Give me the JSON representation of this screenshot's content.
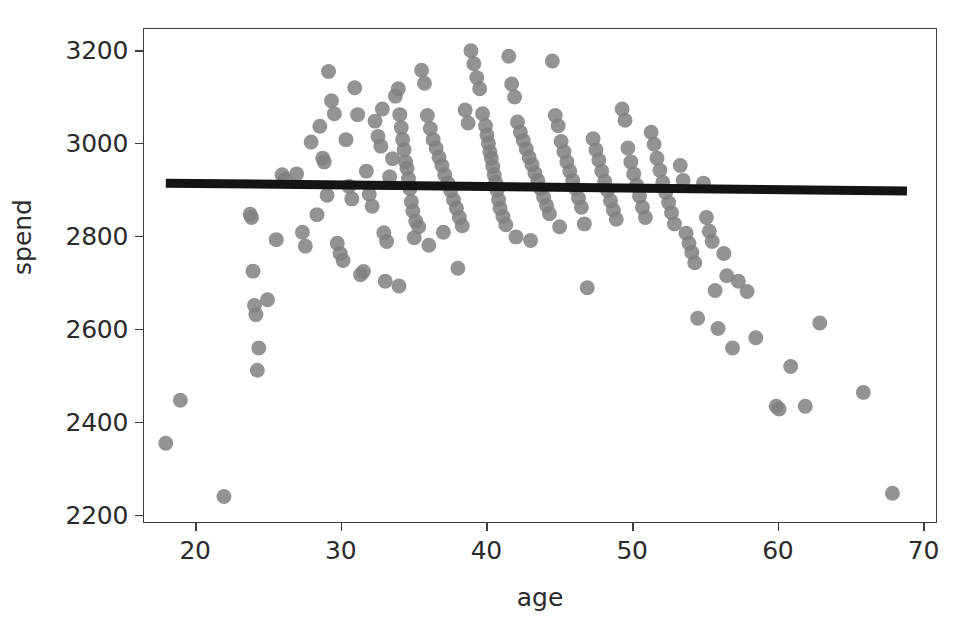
{
  "chart_data": {
    "type": "scatter",
    "title": "",
    "xlabel": "age",
    "ylabel": "spend",
    "xlim": [
      16.5,
      71.0
    ],
    "ylim": [
      2180,
      3245
    ],
    "xticks": [
      20,
      30,
      40,
      50,
      60,
      70
    ],
    "xtick_labels": [
      "20",
      "30",
      "40",
      "50",
      "60",
      "70"
    ],
    "yticks": [
      2200,
      2400,
      2600,
      2800,
      3000,
      3200
    ],
    "ytick_labels": [
      "2200",
      "2400",
      "2600",
      "2800",
      "3000",
      "3200"
    ],
    "grid": false,
    "legend": null,
    "marker": {
      "shape": "circle",
      "color": "#808080",
      "size_px": 15,
      "opacity": 0.85,
      "edge": "none"
    },
    "fit_line": {
      "name": "regression line",
      "color": "#141414",
      "width_px": 9,
      "x_start": 18.0,
      "x_end": 69.0,
      "y_start": 2912,
      "y_end": 2895
    },
    "series": [
      {
        "name": "spend vs age",
        "points": [
          [
            18.0,
            2350
          ],
          [
            19.0,
            2443
          ],
          [
            22.0,
            2235
          ],
          [
            23.8,
            2845
          ],
          [
            23.9,
            2838
          ],
          [
            24.0,
            2722
          ],
          [
            24.1,
            2648
          ],
          [
            24.2,
            2628
          ],
          [
            24.3,
            2508
          ],
          [
            24.4,
            2556
          ],
          [
            25.0,
            2660
          ],
          [
            25.6,
            2790
          ],
          [
            26.0,
            2930
          ],
          [
            26.2,
            2920
          ],
          [
            27.4,
            2806
          ],
          [
            27.6,
            2776
          ],
          [
            28.0,
            3001
          ],
          [
            28.6,
            3035
          ],
          [
            28.8,
            2966
          ],
          [
            28.9,
            2958
          ],
          [
            29.2,
            3153
          ],
          [
            29.4,
            3090
          ],
          [
            29.6,
            3062
          ],
          [
            29.8,
            2782
          ],
          [
            30.0,
            2760
          ],
          [
            30.2,
            2745
          ],
          [
            30.6,
            2905
          ],
          [
            30.8,
            2878
          ],
          [
            31.0,
            3118
          ],
          [
            31.2,
            3060
          ],
          [
            31.4,
            2714
          ],
          [
            31.6,
            2721
          ],
          [
            32.0,
            2888
          ],
          [
            32.2,
            2862
          ],
          [
            32.4,
            3046
          ],
          [
            32.6,
            3013
          ],
          [
            32.8,
            2992
          ],
          [
            33.0,
            2805
          ],
          [
            33.2,
            2786
          ],
          [
            33.4,
            2926
          ],
          [
            33.6,
            2965
          ],
          [
            33.8,
            3100
          ],
          [
            34.0,
            3116
          ],
          [
            34.1,
            3060
          ],
          [
            34.2,
            3032
          ],
          [
            34.3,
            3006
          ],
          [
            34.4,
            2984
          ],
          [
            34.5,
            2958
          ],
          [
            34.6,
            2944
          ],
          [
            34.7,
            2922
          ],
          [
            34.8,
            2900
          ],
          [
            34.9,
            2872
          ],
          [
            35.0,
            2852
          ],
          [
            35.2,
            2830
          ],
          [
            35.4,
            2818
          ],
          [
            35.6,
            3156
          ],
          [
            35.8,
            3128
          ],
          [
            36.0,
            3058
          ],
          [
            36.2,
            3030
          ],
          [
            36.4,
            3006
          ],
          [
            36.6,
            2988
          ],
          [
            36.8,
            2968
          ],
          [
            37.0,
            2950
          ],
          [
            37.2,
            2930
          ],
          [
            37.4,
            2912
          ],
          [
            37.6,
            2896
          ],
          [
            37.8,
            2876
          ],
          [
            38.0,
            2858
          ],
          [
            38.2,
            2838
          ],
          [
            38.4,
            2820
          ],
          [
            38.6,
            3070
          ],
          [
            38.8,
            3042
          ],
          [
            39.0,
            3198
          ],
          [
            39.2,
            3170
          ],
          [
            39.4,
            3140
          ],
          [
            39.6,
            3116
          ],
          [
            39.8,
            3062
          ],
          [
            40.0,
            3036
          ],
          [
            40.1,
            3016
          ],
          [
            40.2,
            2998
          ],
          [
            40.3,
            2980
          ],
          [
            40.4,
            2966
          ],
          [
            40.5,
            2948
          ],
          [
            40.6,
            2930
          ],
          [
            40.7,
            2914
          ],
          [
            40.8,
            2896
          ],
          [
            40.9,
            2876
          ],
          [
            41.0,
            2858
          ],
          [
            41.2,
            2840
          ],
          [
            41.4,
            2822
          ],
          [
            41.6,
            3186
          ],
          [
            41.8,
            3126
          ],
          [
            42.0,
            3098
          ],
          [
            42.2,
            3044
          ],
          [
            42.4,
            3022
          ],
          [
            42.6,
            3004
          ],
          [
            42.8,
            2986
          ],
          [
            43.0,
            2968
          ],
          [
            43.2,
            2952
          ],
          [
            43.4,
            2934
          ],
          [
            43.6,
            2918
          ],
          [
            43.8,
            2900
          ],
          [
            44.0,
            2882
          ],
          [
            44.2,
            2864
          ],
          [
            44.4,
            2846
          ],
          [
            44.6,
            3176
          ],
          [
            44.8,
            3058
          ],
          [
            45.0,
            3036
          ],
          [
            45.2,
            3002
          ],
          [
            45.4,
            2980
          ],
          [
            45.6,
            2958
          ],
          [
            45.8,
            2938
          ],
          [
            46.0,
            2918
          ],
          [
            46.2,
            2900
          ],
          [
            46.4,
            2880
          ],
          [
            46.6,
            2860
          ],
          [
            46.8,
            2824
          ],
          [
            47.0,
            2686
          ],
          [
            47.4,
            3008
          ],
          [
            47.6,
            2984
          ],
          [
            47.8,
            2962
          ],
          [
            48.0,
            2938
          ],
          [
            48.2,
            2916
          ],
          [
            48.4,
            2896
          ],
          [
            48.6,
            2874
          ],
          [
            48.8,
            2854
          ],
          [
            49.0,
            2834
          ],
          [
            49.4,
            3072
          ],
          [
            49.6,
            3048
          ],
          [
            49.8,
            2988
          ],
          [
            50.0,
            2958
          ],
          [
            50.2,
            2932
          ],
          [
            50.4,
            2908
          ],
          [
            50.6,
            2884
          ],
          [
            50.8,
            2860
          ],
          [
            51.0,
            2838
          ],
          [
            51.4,
            3022
          ],
          [
            51.6,
            2996
          ],
          [
            51.8,
            2966
          ],
          [
            52.0,
            2940
          ],
          [
            52.2,
            2914
          ],
          [
            52.4,
            2892
          ],
          [
            52.6,
            2870
          ],
          [
            52.8,
            2848
          ],
          [
            53.0,
            2824
          ],
          [
            53.4,
            2950
          ],
          [
            53.6,
            2918
          ],
          [
            53.8,
            2804
          ],
          [
            54.0,
            2782
          ],
          [
            54.2,
            2762
          ],
          [
            54.4,
            2740
          ],
          [
            54.6,
            2620
          ],
          [
            55.0,
            2912
          ],
          [
            55.2,
            2838
          ],
          [
            55.4,
            2808
          ],
          [
            55.6,
            2786
          ],
          [
            55.8,
            2680
          ],
          [
            56.0,
            2598
          ],
          [
            56.4,
            2760
          ],
          [
            56.6,
            2712
          ],
          [
            57.0,
            2556
          ],
          [
            57.4,
            2700
          ],
          [
            58.0,
            2678
          ],
          [
            58.6,
            2578
          ],
          [
            60.0,
            2430
          ],
          [
            60.2,
            2424
          ],
          [
            61.0,
            2516
          ],
          [
            62.0,
            2430
          ],
          [
            63.0,
            2610
          ],
          [
            66.0,
            2460
          ],
          [
            68.0,
            2242
          ],
          [
            35.1,
            2794
          ],
          [
            36.1,
            2778
          ],
          [
            37.1,
            2806
          ],
          [
            42.1,
            2796
          ],
          [
            43.1,
            2788
          ],
          [
            45.1,
            2818
          ],
          [
            33.1,
            2700
          ],
          [
            34.05,
            2690
          ],
          [
            38.1,
            2728
          ],
          [
            30.4,
            3006
          ],
          [
            31.8,
            2938
          ],
          [
            32.9,
            3072
          ],
          [
            29.1,
            2886
          ],
          [
            28.4,
            2844
          ],
          [
            27.0,
            2932
          ]
        ]
      }
    ]
  }
}
